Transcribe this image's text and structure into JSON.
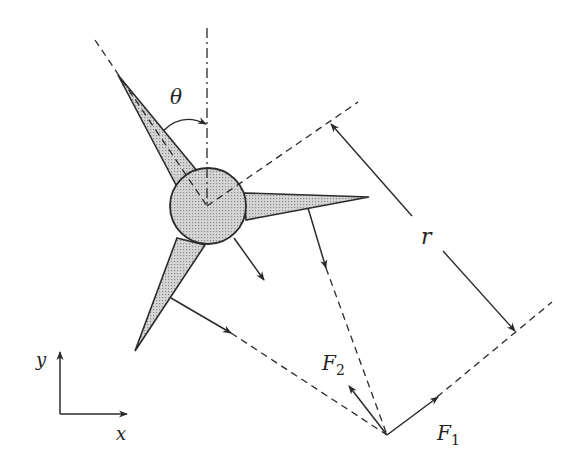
{
  "diagram": {
    "colors": {
      "line": "#2a2a2a",
      "fill": "#c8c8c8",
      "background": "#ffffff"
    },
    "labels": {
      "theta": "θ",
      "r": "r",
      "f1_main": "F",
      "f1_sub": "1",
      "f2_main": "F",
      "f2_sub": "2",
      "axis_x": "x",
      "axis_y": "y"
    },
    "elements": [
      "hub-circle",
      "blade-upper-left",
      "blade-right",
      "blade-lower-left",
      "vertical-reference-line",
      "angle-arc-theta",
      "dimension-r",
      "force-arrow-F1",
      "force-arrow-F2",
      "coordinate-axes"
    ]
  }
}
